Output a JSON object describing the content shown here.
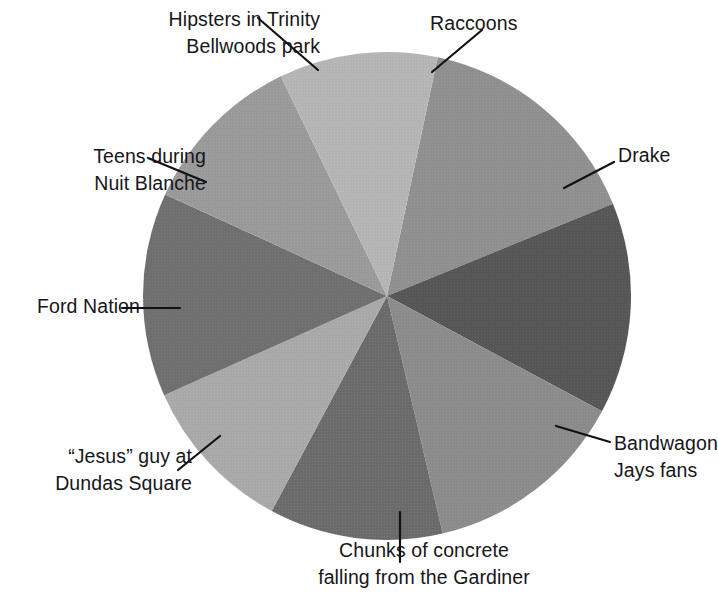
{
  "chart_data": {
    "type": "pie",
    "title": "",
    "subtitle": "",
    "xlabel": "",
    "ylabel": "",
    "legend_position": "callout-labels",
    "grid": false,
    "center": {
      "x": 387,
      "y": 296
    },
    "radius": 244,
    "start_angle_deg": -78,
    "categories": [
      "Raccoons",
      "Drake",
      "Bandwagon Jays fans",
      "Chunks of concrete falling from the Gardiner",
      "“Jesus” guy at Dundas Square",
      "Ford Nation",
      "Teens during Nuit Blanche",
      "Hipsters in Trinity Bellwoods park"
    ],
    "values": [
      15.5,
      14.0,
      13.5,
      11.5,
      10.5,
      13.5,
      11.0,
      10.5
    ],
    "colors": [
      "#8f8f8f",
      "#565656",
      "#8b8b8b",
      "#6a6a6a",
      "#a8a8a8",
      "#6f6f6f",
      "#999999",
      "#b4b4b4"
    ],
    "slices": [
      {
        "label": "Raccoons",
        "value": 15.5,
        "start_deg": -78.0,
        "end_deg": -22.2,
        "color": "#8f8f8f"
      },
      {
        "label": "Drake",
        "value": 14.0,
        "start_deg": -22.2,
        "end_deg": 28.2,
        "color": "#565656"
      },
      {
        "label": "Bandwagon Jays fans",
        "value": 13.5,
        "start_deg": 28.2,
        "end_deg": 76.8,
        "color": "#8b8b8b"
      },
      {
        "label": "Chunks of concrete falling from the Gardiner",
        "value": 11.5,
        "start_deg": 76.8,
        "end_deg": 118.2,
        "color": "#6a6a6a"
      },
      {
        "label": "“Jesus” guy at Dundas Square",
        "value": 10.5,
        "start_deg": 118.2,
        "end_deg": 156.0,
        "color": "#a8a8a8"
      },
      {
        "label": "Ford Nation",
        "value": 13.5,
        "start_deg": 156.0,
        "end_deg": 204.6,
        "color": "#6f6f6f"
      },
      {
        "label": "Teens during Nuit Blanche",
        "value": 11.0,
        "start_deg": 204.6,
        "end_deg": 244.2,
        "color": "#999999"
      },
      {
        "label": "Hipsters in Trinity Bellwoods park",
        "value": 10.5,
        "start_deg": 244.2,
        "end_deg": 282.0,
        "color": "#b4b4b4"
      }
    ]
  },
  "labels": {
    "hipsters": {
      "line1": "Hipsters in Trinity",
      "line2": "Bellwoods park"
    },
    "raccoons": {
      "line1": "Raccoons",
      "line2": ""
    },
    "drake": {
      "line1": "Drake",
      "line2": ""
    },
    "teens": {
      "line1": "Teens during",
      "line2": "Nuit Blanche"
    },
    "ford": {
      "line1": "Ford Nation",
      "line2": ""
    },
    "jesus": {
      "line1": "“Jesus” guy at",
      "line2": "Dundas Square"
    },
    "chunks": {
      "line1": "Chunks of concrete",
      "line2": "falling from the Gardiner"
    },
    "bandwagon": {
      "line1": "Bandwagon",
      "line2": "Jays fans"
    }
  },
  "style": {
    "background": "#ffffff",
    "text_color": "#16161a",
    "leader_color": "#111111"
  }
}
